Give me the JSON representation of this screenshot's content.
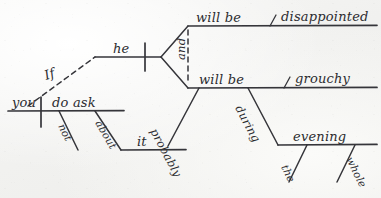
{
  "page": {
    "medium": "handwritten ink on paper",
    "background_color": "#f2f2ef",
    "ink_color": "#35353a",
    "sentence": "If you do not ask about it, he will probably be disappointed and grouchy during the whole evening."
  },
  "independent_clause": {
    "subject": "he",
    "predicate_branches": [
      {
        "verb": "will be",
        "complement": "disappointed",
        "complement_mark": "\\"
      },
      {
        "verb": "will be",
        "complement": "grouchy",
        "complement_mark": "\\"
      }
    ],
    "conjunction": "and",
    "adverb": "probably",
    "prepositional_phrase": {
      "preposition": "during",
      "object": "evening",
      "object_modifiers": [
        "the",
        "whole"
      ]
    }
  },
  "dependent_clause": {
    "subordinator": "If",
    "subject": "you",
    "verb": "do ask",
    "adverb": "not",
    "prepositional_phrase": {
      "preposition": "about",
      "object": "it"
    }
  },
  "labels": {
    "if": "If",
    "you": "you",
    "do_ask": "do ask",
    "not": "not",
    "about": "about",
    "it": "it",
    "he": "he",
    "and": "and",
    "will_be_top": "will be",
    "disappointed": "disappointed",
    "slash_top": "\\",
    "will_be_bottom": "will be",
    "grouchy": "grouchy",
    "slash_bottom": "\\",
    "probably": "probably",
    "during": "during",
    "evening": "evening",
    "the": "the",
    "whole": "whole"
  }
}
